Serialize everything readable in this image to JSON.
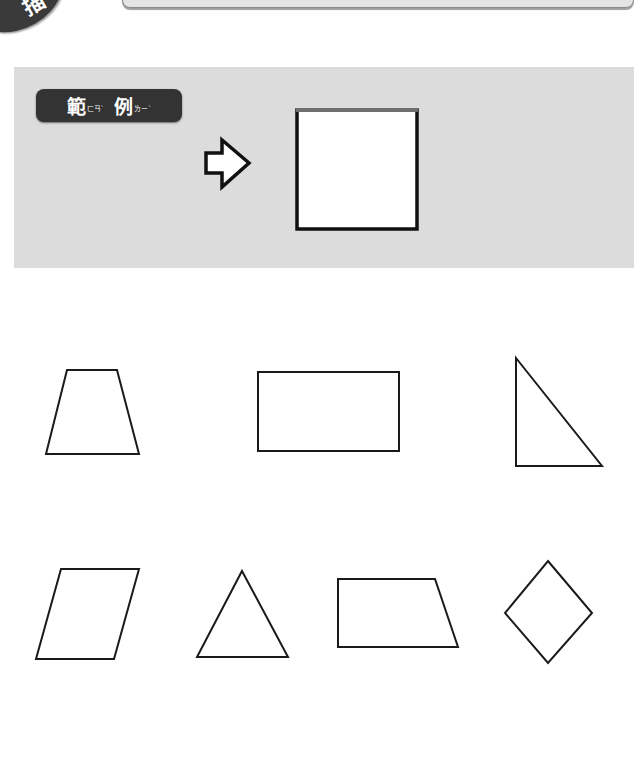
{
  "header": {
    "corner_badge_char": "描",
    "title": ""
  },
  "example": {
    "label_char_1": "範",
    "label_ruby_1": "ㄈㄢˋ",
    "label_char_2": "例",
    "label_ruby_2": "ㄌㄧˋ",
    "arrow_icon": "right-arrow-outline",
    "answer_shape": "square"
  },
  "shapes": [
    {
      "name": "trapezoid",
      "points": "67,370 117,370 139,454 46,454"
    },
    {
      "name": "rectangle",
      "points": "258,372 399,372 399,451 258,451"
    },
    {
      "name": "right-triangle",
      "points": "516,358 602,466 516,466"
    },
    {
      "name": "parallelogram",
      "points": "61,569 139,569 114,659 36,659"
    },
    {
      "name": "triangle",
      "points": "242,571 288,657 197,657"
    },
    {
      "name": "right-trapezoid",
      "points": "338,579 435,579 458,647 338,647"
    },
    {
      "name": "rhombus",
      "points": "548,561 592,613 548,663 505,613"
    }
  ],
  "colors": {
    "panel": "#dcdcdc",
    "label_bg": "#333333",
    "stroke": "#1a1a1a"
  }
}
